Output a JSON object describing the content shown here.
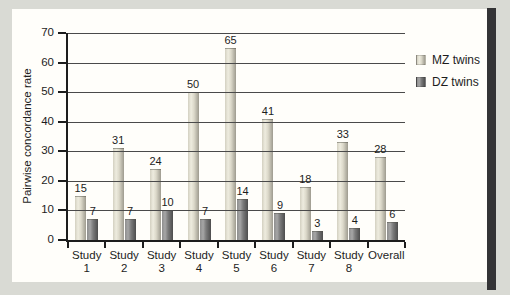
{
  "page": {
    "background_color": "#d9dad4",
    "panel_color": "#fffefa",
    "edge_strip_color": "#343436",
    "grid_color": "#4a4a4a",
    "axis_color": "#1d1d1d",
    "text_color": "#1d1d1d"
  },
  "chart_data": {
    "type": "bar",
    "title": "",
    "ylabel": "Pairwise concordance rate",
    "xlabel": "",
    "ylim": [
      0,
      70
    ],
    "yticks": [
      0,
      10,
      20,
      30,
      40,
      50,
      60,
      70
    ],
    "grid": true,
    "gridlines_on_top_of_bars": true,
    "value_labels": true,
    "legend_position": "right",
    "categories": [
      "Study 1",
      "Study 2",
      "Study 3",
      "Study 4",
      "Study 5",
      "Study 6",
      "Study 7",
      "Study 8",
      "Overall"
    ],
    "series": [
      {
        "name": "MZ twins",
        "values": [
          15,
          31,
          24,
          50,
          65,
          41,
          18,
          33,
          28
        ],
        "gradient": [
          "#d3d0c1",
          "#eeecdf",
          "#dcd9ca",
          "#9e9b8f"
        ]
      },
      {
        "name": "DZ twins",
        "values": [
          7,
          7,
          10,
          7,
          14,
          9,
          3,
          4,
          6
        ],
        "gradient": [
          "#8e8e8e",
          "#a6a6a6",
          "#7b7b7b",
          "#4d4d4d"
        ]
      }
    ]
  }
}
